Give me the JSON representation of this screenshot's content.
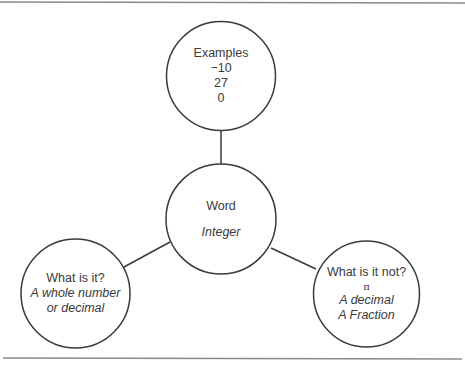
{
  "diagram": {
    "type": "concept-map",
    "rule_color": "#777777",
    "stroke_color": "#3a3a3a",
    "center": {
      "title": "Word",
      "term": "Integer"
    },
    "top": {
      "title": "Examples",
      "items": [
        "−10",
        "27",
        "0"
      ]
    },
    "left": {
      "title": "What is it?",
      "lines": [
        "A whole number",
        "or decimal"
      ]
    },
    "right": {
      "title": "What is it not?",
      "symbol": "π",
      "lines": [
        "A decimal",
        "A Fraction"
      ]
    }
  }
}
